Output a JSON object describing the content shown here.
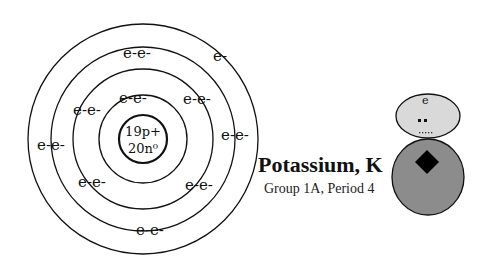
{
  "diagram": {
    "element_name": "Potassium, K",
    "element_info": "Group 1A, Period 4",
    "nucleus": {
      "protons": "19p+",
      "neutrons": "20n⁰"
    },
    "shells": [
      {
        "shell": 1,
        "electrons": [
          "e-e-"
        ]
      },
      {
        "shell": 2,
        "electrons": [
          "e-e-",
          "e-e-",
          "e-e-",
          "e-e-"
        ]
      },
      {
        "shell": 3,
        "electrons": [
          "e-e-",
          "e-e-",
          "e-e-",
          "e-e-"
        ]
      },
      {
        "shell": 4,
        "electrons": [
          "e-"
        ]
      }
    ],
    "labels": {
      "s1_top": "e-e-",
      "s2_top_left": "e-e-",
      "s2_top_right": "e-e-",
      "s2_bottom_left": "e-e-",
      "s2_bottom_right": "e-e-",
      "s3_top": "e-e-",
      "s3_left": "e-e-",
      "s3_right": "e-e-",
      "s3_bottom": "e-e-",
      "s4_single": "e-"
    },
    "figure": {
      "head_label": "e",
      "head_color": "#d9d9d9",
      "body_color": "#8c8c8c",
      "diamond_color": "#000000"
    }
  }
}
